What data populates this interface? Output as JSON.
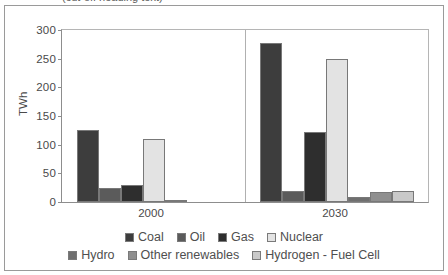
{
  "top_sliver": {
    "text": "(cut-off heading text)"
  },
  "chart_data": {
    "type": "bar",
    "title": "",
    "subtitle": "",
    "xlabel": "",
    "ylabel": "TWh",
    "categories": [
      "2000",
      "2030"
    ],
    "ylim": [
      0,
      300
    ],
    "yticks": [
      300,
      250,
      200,
      150,
      100,
      50,
      0
    ],
    "grid": false,
    "legend_position": "bottom",
    "series": [
      {
        "name": "Coal",
        "values": [
          126,
          277
        ],
        "color": "#3d3d3d"
      },
      {
        "name": "Oil",
        "values": [
          25,
          19
        ],
        "color": "#5b5b5b"
      },
      {
        "name": "Gas",
        "values": [
          29,
          122
        ],
        "color": "#2e2e2e"
      },
      {
        "name": "Nuclear",
        "values": [
          110,
          250
        ],
        "color": "#e3e3e3"
      },
      {
        "name": "Hydro",
        "values": [
          4,
          8
        ],
        "color": "#6f6f6f"
      },
      {
        "name": "Other renewables",
        "values": [
          0,
          17
        ],
        "color": "#8f8f8f"
      },
      {
        "name": "Hydrogen - Fuel Cell",
        "values": [
          0,
          19
        ],
        "color": "#c9c9c9"
      }
    ]
  },
  "legend": {
    "row1": [
      {
        "label": "Coal",
        "color": "#3d3d3d"
      },
      {
        "label": "Oil",
        "color": "#5b5b5b"
      },
      {
        "label": "Gas",
        "color": "#2e2e2e"
      },
      {
        "label": "Nuclear",
        "color": "#e3e3e3"
      }
    ],
    "row2": [
      {
        "label": "Hydro",
        "color": "#6f6f6f"
      },
      {
        "label": "Other renewables",
        "color": "#8f8f8f"
      },
      {
        "label": "Hydrogen - Fuel Cell",
        "color": "#c9c9c9"
      }
    ]
  }
}
